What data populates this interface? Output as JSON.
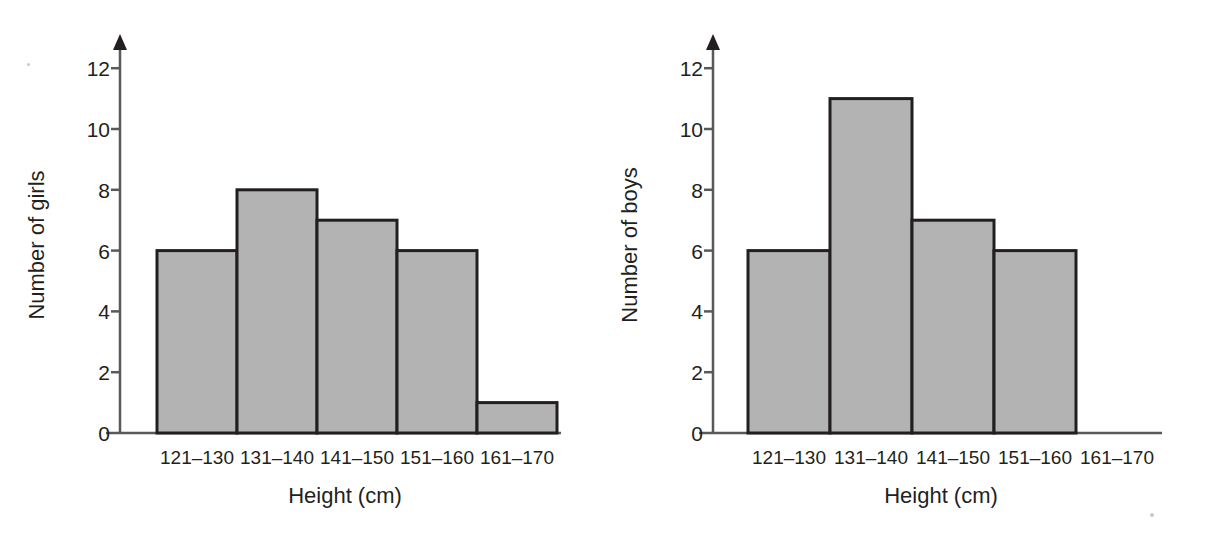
{
  "figure": {
    "background_color": "#ffffff",
    "ink_color": "#231f20",
    "axis_color": "#58595b",
    "bar_fill_color": "#b3b3b3",
    "bar_stroke_color": "#231f20",
    "panel_count": 2
  },
  "chart_data": [
    {
      "type": "bar",
      "id": "girls-histogram",
      "title": "",
      "subtitle": "",
      "categories": [
        "121–130",
        "131–140",
        "141–150",
        "151–160",
        "161–170"
      ],
      "values": [
        6,
        8,
        7,
        6,
        1
      ],
      "xlabel": "Height (cm)",
      "ylabel": "Number of girls",
      "ylim": [
        0,
        13
      ],
      "yticks": [
        0,
        2,
        4,
        6,
        8,
        10,
        12
      ],
      "ytick_labels": [
        "0",
        "2",
        "4",
        "6",
        "8",
        "10",
        "12"
      ],
      "grid": false,
      "legend": "none",
      "axis_arrow": "y-axis-up"
    },
    {
      "type": "bar",
      "id": "boys-histogram",
      "title": "",
      "subtitle": "",
      "categories": [
        "121–130",
        "131–140",
        "141–150",
        "151–160",
        "161–170"
      ],
      "values": [
        6,
        11,
        7,
        6,
        0
      ],
      "xlabel": "Height (cm)",
      "ylabel": "Number of boys",
      "ylim": [
        0,
        13
      ],
      "yticks": [
        0,
        2,
        4,
        6,
        8,
        10,
        12
      ],
      "ytick_labels": [
        "0",
        "2",
        "4",
        "6",
        "8",
        "10",
        "12"
      ],
      "grid": false,
      "legend": "none",
      "axis_arrow": "y-axis-up"
    }
  ]
}
